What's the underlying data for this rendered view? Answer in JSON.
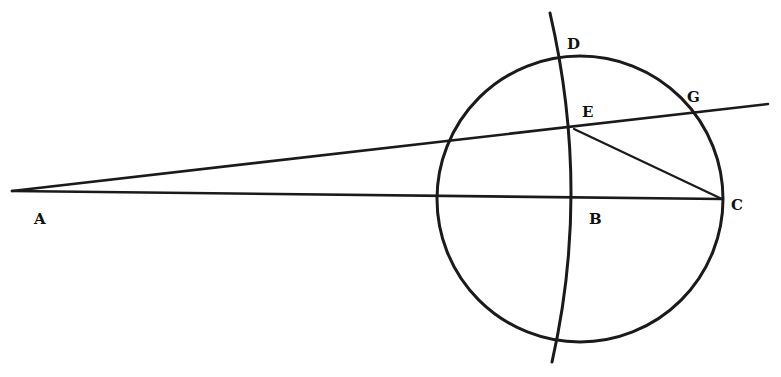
{
  "diagram": {
    "type": "geometric-construction",
    "colors": {
      "ink": "#1a1a1a",
      "background": "#ffffff"
    },
    "points": {
      "A": {
        "label": "A",
        "x": 12,
        "y": 192,
        "label_x": 34,
        "label_y": 224
      },
      "B": {
        "label": "B",
        "x": 577,
        "y": 197,
        "label_x": 589,
        "label_y": 224
      },
      "C": {
        "label": "C",
        "x": 722,
        "y": 199,
        "label_x": 731,
        "label_y": 210
      },
      "D": {
        "label": "D",
        "x": 563,
        "y": 59,
        "label_x": 567,
        "label_y": 49
      },
      "E": {
        "label": "E",
        "x": 574,
        "y": 129,
        "label_x": 582,
        "label_y": 117
      },
      "G": {
        "label": "G",
        "x": 697,
        "y": 114,
        "label_x": 687,
        "label_y": 102
      }
    },
    "circle": {
      "cx": 580,
      "cy": 199,
      "r": 143
    },
    "segments": [
      {
        "name": "line-AC",
        "from": "A",
        "to": "C"
      },
      {
        "name": "line-AEG",
        "from": "A",
        "to": "G-extended"
      },
      {
        "name": "line-EC",
        "from": "E",
        "to": "C"
      }
    ],
    "arc": {
      "name": "arc-DEB",
      "passes_through": [
        "D",
        "E",
        "B"
      ]
    }
  }
}
